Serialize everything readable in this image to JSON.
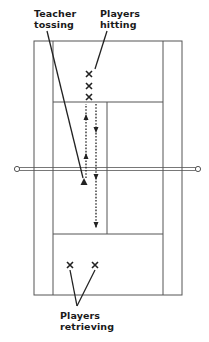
{
  "diagram": {
    "labels": {
      "teacher": [
        "Teacher",
        "tossing"
      ],
      "hitters": [
        "Players",
        "hitting"
      ],
      "retrievers": [
        "Players",
        "retrieving"
      ]
    },
    "markers": {
      "player_symbol": "X",
      "teacher_symbol": "triangle"
    },
    "colors": {
      "line": "#222222",
      "court_line": "#555555",
      "background": "#ffffff"
    }
  }
}
